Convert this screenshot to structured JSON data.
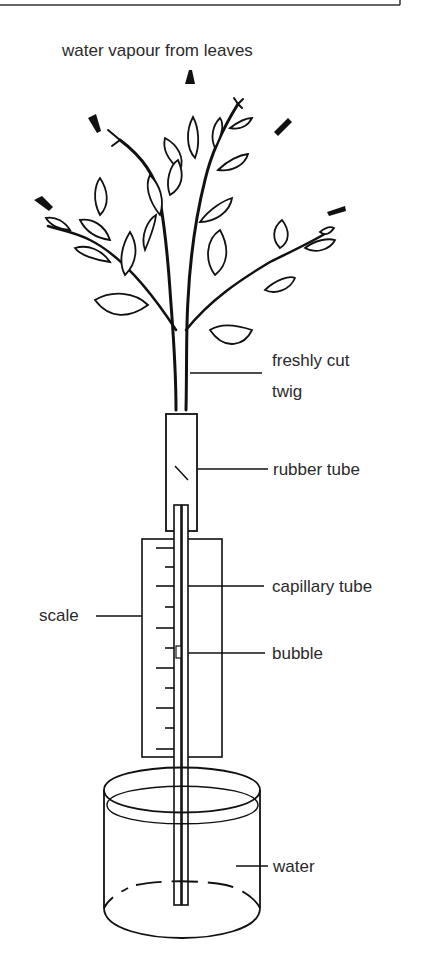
{
  "diagram": {
    "title": "water vapour from leaves",
    "labels": {
      "twig_line1": "freshly cut",
      "twig_line2": "twig",
      "rubber_tube": "rubber tube",
      "capillary_tube": "capillary tube",
      "scale": "scale",
      "bubble": "bubble",
      "water": "water"
    },
    "components": [
      "freshly cut twig",
      "rubber tube",
      "capillary tube",
      "scale",
      "bubble",
      "water",
      "beaker"
    ],
    "scale_ticks": 12,
    "colors": {
      "ink": "#111111",
      "text": "#2a2a2a",
      "background": "#ffffff"
    }
  }
}
